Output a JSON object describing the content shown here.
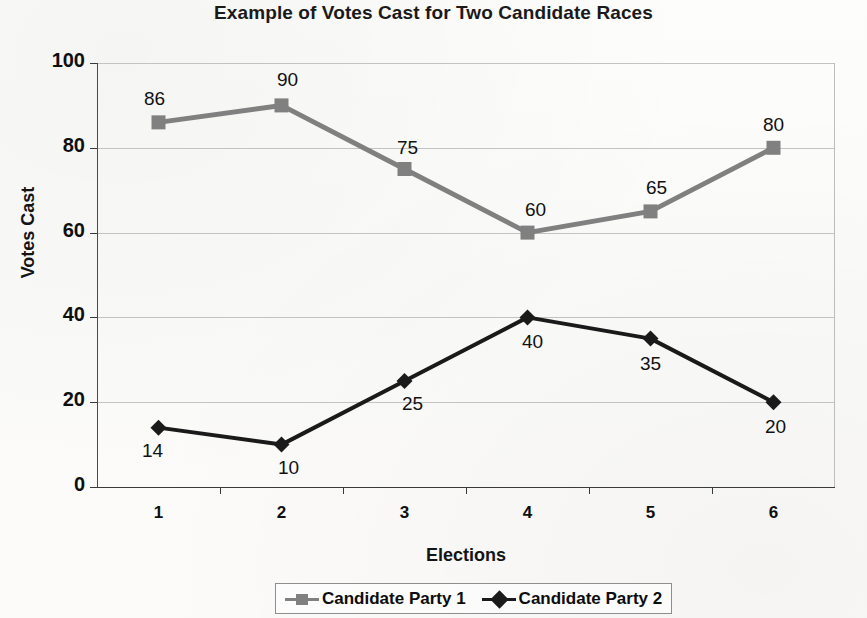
{
  "chart_data": {
    "type": "line",
    "title": "Example of Votes Cast for Two Candidate Races",
    "xlabel": "Elections",
    "ylabel": "Votes Cast",
    "categories": [
      "1",
      "2",
      "3",
      "4",
      "5",
      "6"
    ],
    "ylim": [
      0,
      100
    ],
    "yticks": [
      "0",
      "20",
      "40",
      "60",
      "80",
      "100"
    ],
    "grid": true,
    "legend_position": "bottom",
    "series": [
      {
        "name": "Candidate Party 1",
        "values": [
          86,
          90,
          75,
          60,
          65,
          80
        ],
        "color": "#808080",
        "marker": "square",
        "label_offsets": [
          {
            "dx": -4,
            "dy": -34
          },
          {
            "dx": 6,
            "dy": -36
          },
          {
            "dx": 3,
            "dy": -32
          },
          {
            "dx": 8,
            "dy": -34
          },
          {
            "dx": 6,
            "dy": -34
          },
          {
            "dx": 0,
            "dy": -34
          }
        ]
      },
      {
        "name": "Candidate Party 2",
        "values": [
          14,
          10,
          25,
          40,
          35,
          20
        ],
        "color": "#1a1a1a",
        "marker": "diamond",
        "label_offsets": [
          {
            "dx": -6,
            "dy": 12
          },
          {
            "dx": 7,
            "dy": 12
          },
          {
            "dx": 8,
            "dy": 12
          },
          {
            "dx": 5,
            "dy": 14
          },
          {
            "dx": 0,
            "dy": 14
          },
          {
            "dx": 2,
            "dy": 14
          }
        ]
      }
    ]
  },
  "legend": {
    "items": [
      {
        "label": "Candidate Party 1",
        "color": "#808080",
        "marker": "square"
      },
      {
        "label": "Candidate Party 2",
        "color": "#1a1a1a",
        "marker": "diamond"
      }
    ]
  },
  "background_text": {
    "lines": [
      {
        "text": "Wera I have...",
        "x": 40,
        "y": 4,
        "size": 16
      },
      {
        "text": "rs that people had been frustrated with the final results of the",
        "x": 36,
        "y": 63,
        "size": 15
      },
      {
        "text": "te elections, and the number of eligible voters that turned out in the",
        "x": 28,
        "y": 91,
        "size": 15
      },
      {
        "text": "prior years had increased a record amount from previous years.",
        "x": 28,
        "y": 119,
        "size": 15
      },
      {
        "text": "The initial reaction from many voters was that of shock and",
        "x": 40,
        "y": 171,
        "size": 15
      },
      {
        "text": "the large portion of the votes that was cast into two parties. However,",
        "x": 28,
        "y": 199,
        "size": 15
      },
      {
        "text": "a much deeper and clearer analysis",
        "x": 28,
        "y": 227,
        "size": 15
      },
      {
        "text": "Finally, I believe that the numbers are accurate and a more",
        "x": 40,
        "y": 283,
        "size": 15
      },
      {
        "text": "detailed breakdown of each candidate and their respective party is",
        "x": 28,
        "y": 311,
        "size": 15
      },
      {
        "text": "necessary before we can fully understand what the voters",
        "x": 28,
        "y": 339,
        "size": 15
      },
      {
        "text": "desire in an election, which is a reflection of the choices.",
        "x": 28,
        "y": 367,
        "size": 15
      },
      {
        "text": "The results for each of these elections can be seen in the",
        "x": 40,
        "y": 423,
        "size": 15
      },
      {
        "text": "chart with the values noted for each of the two parties above.",
        "x": 28,
        "y": 451,
        "size": 15
      },
      {
        "text": "There is a visible trend in the data as the numbers shifted.",
        "x": 28,
        "y": 479,
        "size": 15
      },
      {
        "text": "and the correlation between them was notable.",
        "x": 28,
        "y": 507,
        "size": 15
      }
    ]
  }
}
